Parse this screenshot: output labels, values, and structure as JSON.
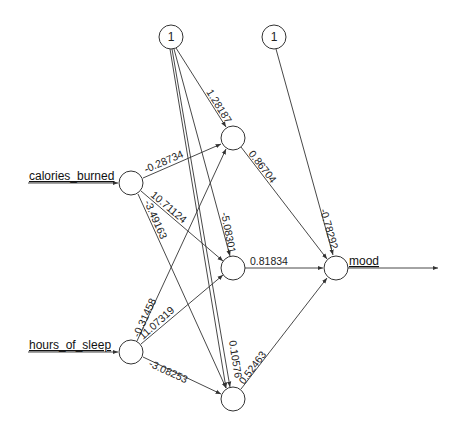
{
  "diagram": {
    "type": "neural-network",
    "inputs": [
      {
        "id": "calories",
        "label": "calories_burned"
      },
      {
        "id": "sleep",
        "label": "hours_of_sleep"
      }
    ],
    "output": {
      "id": "mood",
      "label": "mood"
    },
    "bias_nodes": [
      {
        "id": "b1",
        "label": "1"
      },
      {
        "id": "b2",
        "label": "1"
      }
    ],
    "hidden_nodes": [
      "H1",
      "H2",
      "H3"
    ],
    "weights": {
      "b1_h1": "1.28187",
      "b1_h2": "-5.08301",
      "b1_h3": "0.10576",
      "cal_h1": "-0.28734",
      "cal_h2": "10.71124",
      "cal_h3": "-3.49163",
      "sleep_h1": "-0.31458",
      "sleep_h2": "11.07319",
      "sleep_h3": "-3.08253",
      "h1_out": "0.86704",
      "h2_out": "0.81834",
      "h3_out": "0.52463",
      "b2_out": "-0.78292"
    }
  }
}
